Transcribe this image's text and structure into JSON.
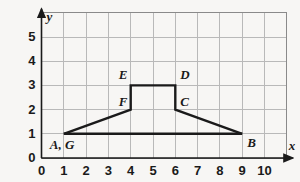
{
  "chart_data": {
    "type": "scatter",
    "title": "",
    "xlabel": "x",
    "ylabel": "y",
    "xlim": [
      0,
      10
    ],
    "ylim": [
      0,
      5
    ],
    "grid": true,
    "legend": "none",
    "x_ticks": [
      "0",
      "1",
      "2",
      "3",
      "4",
      "5",
      "6",
      "7",
      "8",
      "9",
      "10"
    ],
    "y_ticks": [
      "0",
      "1",
      "2",
      "3",
      "4",
      "5"
    ],
    "x_tick_values": [
      0,
      1,
      2,
      3,
      4,
      5,
      6,
      7,
      8,
      9,
      10
    ],
    "y_tick_values": [
      0,
      1,
      2,
      3,
      4,
      5
    ],
    "grid_x_range": [
      0,
      11
    ],
    "grid_y_range": [
      0,
      6
    ],
    "series": [
      {
        "name": "polygon-outline",
        "closed": false,
        "points": [
          {
            "label": "A, G",
            "x": 1,
            "y": 1
          },
          {
            "label": "F",
            "x": 4,
            "y": 2
          },
          {
            "label": "E",
            "x": 4,
            "y": 3
          },
          {
            "label": "D",
            "x": 6,
            "y": 3
          },
          {
            "label": "C",
            "x": 6,
            "y": 2
          },
          {
            "label": "B",
            "x": 9,
            "y": 1
          }
        ]
      },
      {
        "name": "base-segment",
        "closed": false,
        "points": [
          {
            "label": "G",
            "x": 1,
            "y": 1
          },
          {
            "label": "B",
            "x": 9,
            "y": 1
          }
        ]
      }
    ],
    "vertex_labels": [
      {
        "id": "label-ag",
        "text": "A, G",
        "x": 1,
        "y": 1,
        "dx": -14,
        "dy": 15
      },
      {
        "id": "label-f",
        "text": "F",
        "x": 4,
        "y": 2,
        "dx": -12,
        "dy": -4
      },
      {
        "id": "label-e",
        "text": "E",
        "x": 4,
        "y": 3,
        "dx": -12,
        "dy": -6
      },
      {
        "id": "label-d",
        "text": "D",
        "x": 6,
        "y": 3,
        "dx": 5,
        "dy": -6
      },
      {
        "id": "label-c",
        "text": "C",
        "x": 6,
        "y": 2,
        "dx": 5,
        "dy": -4
      },
      {
        "id": "label-b",
        "text": "B",
        "x": 9,
        "y": 1,
        "dx": 5,
        "dy": 13
      }
    ],
    "colors": {
      "background": "#f7f6f4",
      "grid_line": "#b9b9b9",
      "grid_border": "#8a8a8a",
      "axis": "#1a1a1a",
      "shape_line": "#1a1a1a",
      "text": "#1a1a1a"
    }
  }
}
